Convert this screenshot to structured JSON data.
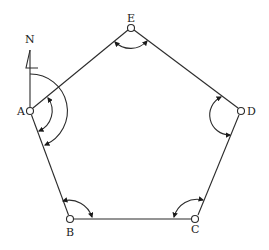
{
  "diagram": {
    "type": "closed traverse (pentagon) with interior angles and bearing",
    "north_label": "N",
    "stations": [
      {
        "id": "A",
        "label": "A"
      },
      {
        "id": "B",
        "label": "B"
      },
      {
        "id": "C",
        "label": "C"
      },
      {
        "id": "D",
        "label": "D"
      },
      {
        "id": "E",
        "label": "E"
      }
    ],
    "edges": [
      [
        "A",
        "B"
      ],
      [
        "B",
        "C"
      ],
      [
        "C",
        "D"
      ],
      [
        "D",
        "E"
      ],
      [
        "E",
        "A"
      ]
    ],
    "angle_markers": [
      {
        "at": "A",
        "kind": "interior angle EAB"
      },
      {
        "at": "A",
        "kind": "bearing from North to AB"
      },
      {
        "at": "B",
        "kind": "interior angle ABC"
      },
      {
        "at": "C",
        "kind": "interior angle BCD"
      },
      {
        "at": "D",
        "kind": "interior angle CDE"
      },
      {
        "at": "E",
        "kind": "interior angle DEA"
      }
    ],
    "colors": {
      "line": "#2b2b2b",
      "background": "#ffffff"
    }
  }
}
